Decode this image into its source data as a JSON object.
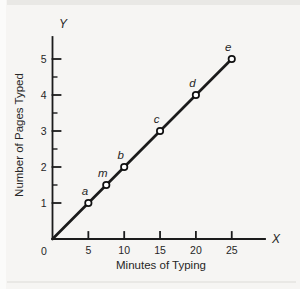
{
  "page": {
    "background": "#f6f5f3",
    "edge_color": "#e9e8e5"
  },
  "chart_data": {
    "type": "line",
    "title": "",
    "xlabel": "Minutes of Typing",
    "ylabel": "Number of Pages Typed",
    "x_axis_letter": "X",
    "y_axis_letter": "Y",
    "origin_label": "0",
    "x_ticks": [
      5,
      10,
      15,
      20,
      25
    ],
    "y_ticks": [
      1,
      2,
      3,
      4,
      5
    ],
    "y_minor_ticks": [
      1.5,
      2.5,
      3.5,
      4.5
    ],
    "xlim": [
      0,
      29.5
    ],
    "ylim": [
      0,
      5.6
    ],
    "grid": false,
    "legend": false,
    "line_segment": {
      "x1": 0,
      "y1": 0,
      "x2": 25,
      "y2": 5
    },
    "points": [
      {
        "label": "a",
        "x": 5,
        "y": 1
      },
      {
        "label": "m",
        "x": 7.5,
        "y": 1.5
      },
      {
        "label": "b",
        "x": 10,
        "y": 2
      },
      {
        "label": "c",
        "x": 15,
        "y": 3
      },
      {
        "label": "d",
        "x": 20,
        "y": 4
      },
      {
        "label": "e",
        "x": 25,
        "y": 5
      }
    ],
    "colors": {
      "axis": "#1b1b1b",
      "line": "#1b1b1b",
      "point_fill": "#ffffff",
      "point_stroke": "#111111",
      "text": "#262626"
    }
  }
}
